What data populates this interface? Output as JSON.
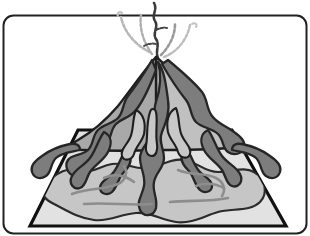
{
  "figure": {
    "kind": "illustration",
    "title": "Volcano with lava flows on a square base",
    "caption": "",
    "background_color": "#ffffff"
  },
  "palette": {
    "background": "#ffffff",
    "outline": "#1a1a1a",
    "frame_stroke": "#222222",
    "base_plate_fill": "#e2e2e2",
    "base_plate_stroke": "#111111",
    "ash_field_fill": "#c6c6c6",
    "ash_field_stroke": "#2b2b2b",
    "cone_light_fill": "#c0c0c0",
    "cone_mid_fill": "#a9a9a9",
    "lava_dark_fill": "#7d7d7d",
    "lava_dark_stroke": "#262626",
    "crack_line": "#8d8d8d",
    "plume_dark": "#3a3a3a",
    "plume_light": "#b4b4b4"
  },
  "frame": {
    "name": "rounded-border-frame",
    "corner_radius": 10,
    "stroke_width": 2,
    "x": 3,
    "y": 15,
    "width": 304,
    "height": 219
  },
  "layers": [
    {
      "id": "base-plate",
      "label": "Square ground base (trapezoid in perspective)",
      "fill": "#e2e2e2"
    },
    {
      "id": "ash-field",
      "label": "Ash / debris field spread over the ground",
      "fill": "#c6c6c6"
    },
    {
      "id": "cone-light",
      "label": "Sunlit right flank of the cone",
      "fill": "#c0c0c0"
    },
    {
      "id": "cone-mid",
      "label": "Shaded left flank of the cone",
      "fill": "#a9a9a9"
    },
    {
      "id": "lava-flows",
      "label": "Dark lava flows running down the slopes",
      "fill": "#7d7d7d"
    },
    {
      "id": "ground-cracks",
      "label": "Fissure lines across the plain",
      "stroke": "#8d8d8d"
    },
    {
      "id": "plume",
      "label": "Eruption plume of ash and smoke",
      "stroke": "#3a3a3a"
    }
  ],
  "geometry": {
    "base_plate_points": "30,226 78,130 232,130 286,226",
    "summit": {
      "x": 156,
      "y": 56
    },
    "crater_line_x": 156
  },
  "plume": {
    "name": "eruption-plume",
    "central_column": "M157,57 C155,50 159,44 156,38 C153,32 158,26 155,20 C152,14 157,9 154,3",
    "arcs": [
      {
        "name": "plume-arc-left-outer",
        "d": "M150,52 C136,44 124,30 121,17",
        "color": "#b4b4b4"
      },
      {
        "name": "plume-arc-left-inner",
        "d": "M153,54 C145,42 140,28 142,14",
        "color": "#b4b4b4"
      },
      {
        "name": "plume-arc-right-inner",
        "d": "M161,54 C170,44 176,33 176,23",
        "color": "#9d9d9d"
      },
      {
        "name": "plume-arc-right-outer",
        "d": "M163,56 C176,50 186,38 189,24",
        "color": "#b4b4b4"
      }
    ]
  },
  "annotations": {
    "has_text_labels": false,
    "label_count": 0,
    "visible_text": []
  }
}
